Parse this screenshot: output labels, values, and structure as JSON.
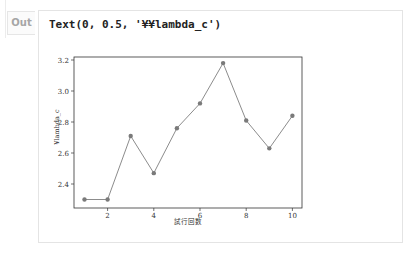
{
  "cell": {
    "prompt_label": "Out",
    "output_text": "Text(0, 0.5, '¥¥lambda_c')"
  },
  "chart_data": {
    "type": "line",
    "title": "",
    "xlabel": "試行回数",
    "ylabel": "¥lambda_c",
    "x": [
      1,
      2,
      3,
      4,
      5,
      6,
      7,
      8,
      9,
      10
    ],
    "series": [
      {
        "name": "lambda_c",
        "values": [
          2.3,
          2.3,
          2.71,
          2.47,
          2.76,
          2.92,
          3.18,
          2.81,
          2.63,
          2.84
        ]
      }
    ],
    "xticks": [
      2,
      4,
      6,
      8,
      10
    ],
    "xtick_labels": [
      "2",
      "4",
      "6",
      "8",
      "10"
    ],
    "yticks": [
      2.4,
      2.6,
      2.8,
      3.0,
      3.2
    ],
    "ytick_labels": [
      "2.4",
      "2.6",
      "2.8",
      "3.0",
      "3.2"
    ],
    "xlim": [
      0.55,
      10.45
    ],
    "ylim": [
      2.27,
      3.21
    ],
    "grid": false,
    "legend": null,
    "marker": "o",
    "line_color": "#8c8c8c",
    "marker_color": "#7a7a7a"
  }
}
